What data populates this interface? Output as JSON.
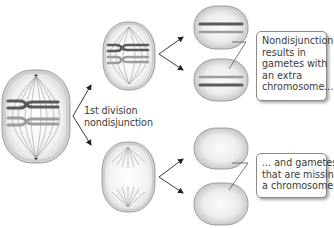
{
  "diagram": {
    "division_label": {
      "line1": "1st division",
      "line2": "nondisjunction"
    },
    "callouts": {
      "extra": {
        "lines": [
          "Nondisjunction",
          "results in",
          "gametes with",
          "an extra",
          "chromosome..."
        ]
      },
      "missing": {
        "lines": [
          "... and gametes",
          "that are missing",
          "a chromosome."
        ]
      }
    },
    "nodes": [
      {
        "id": "parent-cell",
        "description": "Cell in metaphase I with two homologous pairs (dark and light) and spindle fibers"
      },
      {
        "id": "daughter-cell-with-both",
        "description": "Daughter cell receiving both homologous chromosomes"
      },
      {
        "id": "daughter-cell-empty",
        "description": "Daughter cell receiving no chromosome of the pair"
      },
      {
        "id": "gamete-extra-1",
        "description": "Gamete with extra chromosome"
      },
      {
        "id": "gamete-extra-2",
        "description": "Gamete with extra chromosome"
      },
      {
        "id": "gamete-missing-1",
        "description": "Gamete missing a chromosome"
      },
      {
        "id": "gamete-missing-2",
        "description": "Gamete missing a chromosome"
      }
    ],
    "colors": {
      "cell_fill": "#d2d2d2",
      "cell_edge": "#8f8f8f",
      "chromosome_dark": "#5a5a5a",
      "chromosome_light": "#9a9a9a",
      "arrow": "#222222",
      "text": "#3a3a3a"
    }
  }
}
